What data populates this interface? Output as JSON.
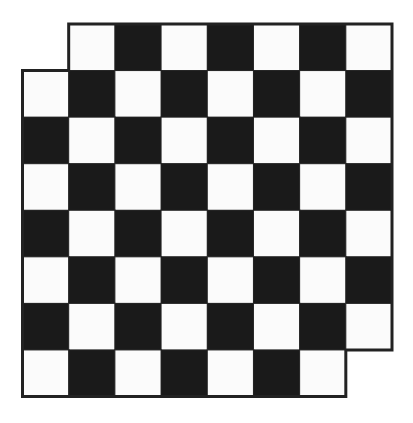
{
  "diagram": {
    "board": {
      "rows": 8,
      "cols": 8,
      "removed_cells": [
        {
          "row": 0,
          "col": 0
        },
        {
          "row": 7,
          "col": 7
        }
      ],
      "light_parity": "odd",
      "colors": {
        "dark": "#1a1a1a",
        "light": "#fbfbfb",
        "border": "#222222",
        "background": "#ffffff"
      }
    }
  }
}
